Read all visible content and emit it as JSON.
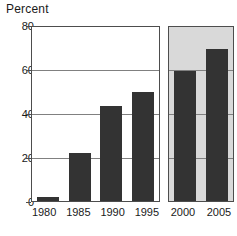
{
  "chart_data": {
    "type": "bar",
    "title": "",
    "ylabel": "Percent",
    "xlabel": "",
    "ylim": [
      0,
      80
    ],
    "yticks": [
      0,
      20,
      40,
      60,
      80
    ],
    "grid": true,
    "legend": "none",
    "categories": [
      "1980",
      "1985",
      "1990",
      "1995",
      "2000",
      "2005"
    ],
    "values": [
      2,
      22,
      43.5,
      50,
      60,
      70
    ],
    "panels": [
      {
        "name": "actual",
        "shaded": false,
        "categories": [
          "1980",
          "1985",
          "1990",
          "1995"
        ],
        "values": [
          2,
          22,
          43.5,
          50
        ]
      },
      {
        "name": "projected",
        "shaded": true,
        "categories": [
          "2000",
          "2005"
        ],
        "values": [
          60,
          70
        ]
      }
    ],
    "colors": {
      "bar": "#333333",
      "projected_panel_background": "#d9d9d9",
      "actual_panel_background": "#ffffff",
      "gridline": "#808080",
      "axis": "#4d4d4d",
      "text": "#1a1a1a"
    }
  }
}
